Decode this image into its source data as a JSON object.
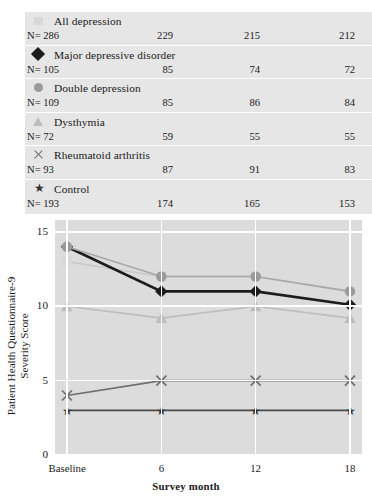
{
  "chart_data": {
    "type": "line",
    "title": "",
    "xlabel": "Survey month",
    "ylabel": "Patient Health Questionnaire-9 Severity Score",
    "ylabel_line1": "Patient Health Questionnaire-9",
    "ylabel_line2": "Severity Score",
    "categories": [
      "Baseline",
      "6",
      "12",
      "18"
    ],
    "x_tick_labels": [
      "Baseline",
      "6",
      "12",
      "18"
    ],
    "y_tick_labels": [
      "0",
      "5",
      "10",
      "15"
    ],
    "y_ticks": [
      0,
      5,
      10,
      15
    ],
    "ylim": [
      0,
      15.8
    ],
    "grid": true,
    "legend_position": "top-table",
    "plot_background": "#dcdcdc",
    "gridline_color": "#ffffff",
    "series": [
      {
        "name": "All depression",
        "marker": "square",
        "color": "#d8d8d8",
        "line_color": "#c9c9c9",
        "values": [
          13,
          12,
          12,
          11
        ],
        "n": [
          286,
          229,
          215,
          212
        ]
      },
      {
        "name": "Major depressive disorder",
        "marker": "diamond",
        "color": "#1c1c1c",
        "line_color": "#1c1c1c",
        "values": [
          14,
          11,
          11,
          10.1
        ],
        "n": [
          105,
          85,
          74,
          72
        ]
      },
      {
        "name": "Double depression",
        "marker": "circle",
        "color": "#9a9a9a",
        "line_color": "#a8a8a8",
        "values": [
          14,
          12,
          12,
          11
        ],
        "n": [
          109,
          85,
          86,
          84
        ]
      },
      {
        "name": "Dysthymia",
        "marker": "triangle",
        "color": "#bdbdbd",
        "line_color": "#bdbdbd",
        "values": [
          10,
          9.2,
          10,
          9.2
        ],
        "n": [
          72,
          59,
          55,
          55
        ]
      },
      {
        "name": "Rheumatoid arthritis",
        "marker": "x",
        "color": "#6e6e6e",
        "line_color": "#6e6e6e",
        "values": [
          4,
          5,
          5,
          5
        ],
        "n": [
          93,
          87,
          91,
          83
        ]
      },
      {
        "name": "Control",
        "marker": "star",
        "color": "#333333",
        "line_color": "#4a4a4a",
        "values": [
          3,
          3,
          3,
          3
        ],
        "n": [
          193,
          174,
          165,
          153
        ]
      }
    ]
  },
  "legend": {
    "n_prefix": "N=",
    "rows": [
      {
        "label": "All depression",
        "marker": "square-icon",
        "n_cells": [
          "N= 286",
          "229",
          "215",
          "212"
        ]
      },
      {
        "label": "Major depressive disorder",
        "marker": "diamond-icon",
        "n_cells": [
          "N= 105",
          "85",
          "74",
          "72"
        ]
      },
      {
        "label": "Double depression",
        "marker": "circle-icon",
        "n_cells": [
          "N= 109",
          "85",
          "86",
          "84"
        ]
      },
      {
        "label": "Dysthymia",
        "marker": "triangle-icon",
        "n_cells": [
          "N= 72",
          "59",
          "55",
          "55"
        ]
      },
      {
        "label": "Rheumatoid arthritis",
        "marker": "x-icon",
        "n_cells": [
          "N= 93",
          "87",
          "91",
          "83"
        ]
      },
      {
        "label": "Control",
        "marker": "star-icon",
        "n_cells": [
          "N= 193",
          "174",
          "165",
          "153"
        ]
      }
    ]
  },
  "axes": {
    "x_title": "Survey month",
    "y_title_line1": "Patient Health Questionnaire-9",
    "y_title_line2": "Severity Score",
    "x_ticks": [
      "Baseline",
      "6",
      "12",
      "18"
    ],
    "y_ticks": [
      "15",
      "10",
      "5",
      "0"
    ]
  },
  "glyphs": {
    "star": "★"
  }
}
